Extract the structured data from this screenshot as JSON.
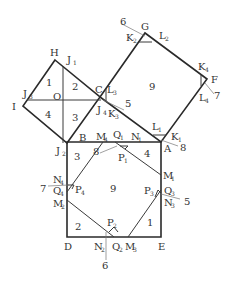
{
  "diagram": {
    "stroke_color": "#2a2a2a",
    "background": "#ffffff",
    "vertices": {
      "H": {
        "label": "H"
      },
      "I": {
        "label": "I"
      },
      "J1": {
        "label": "J",
        "sub": "1"
      },
      "J2": {
        "label": "J",
        "sub": "2"
      },
      "J3": {
        "label": "J",
        "sub": "3"
      },
      "J4": {
        "label": "J",
        "sub": "4"
      },
      "O": {
        "label": "O"
      },
      "C": {
        "label": "C"
      },
      "G": {
        "label": "G"
      },
      "F": {
        "label": "F"
      },
      "K1": {
        "label": "K",
        "sub": "1"
      },
      "K2": {
        "label": "K",
        "sub": "2"
      },
      "K3": {
        "label": "K",
        "sub": "3"
      },
      "K4": {
        "label": "K",
        "sub": "4"
      },
      "L1": {
        "label": "L",
        "sub": "1"
      },
      "L2": {
        "label": "L",
        "sub": "2"
      },
      "L3": {
        "label": "L",
        "sub": "3"
      },
      "L4": {
        "label": "L",
        "sub": "4"
      },
      "A": {
        "label": "A"
      },
      "B": {
        "label": "B"
      },
      "D": {
        "label": "D"
      },
      "E": {
        "label": "E"
      },
      "M1": {
        "label": "M",
        "sub": "1"
      },
      "M2": {
        "label": "M",
        "sub": "2"
      },
      "M3": {
        "label": "M",
        "sub": "3"
      },
      "M4": {
        "label": "M",
        "sub": "4"
      },
      "N1": {
        "label": "N",
        "sub": "1"
      },
      "N2": {
        "label": "N",
        "sub": "2"
      },
      "N3": {
        "label": "N",
        "sub": "3"
      },
      "N4": {
        "label": "N",
        "sub": "4"
      },
      "P1": {
        "label": "P",
        "sub": "1"
      },
      "P2": {
        "label": "P",
        "sub": "2"
      },
      "P3": {
        "label": "P",
        "sub": "3"
      },
      "P4": {
        "label": "P",
        "sub": "4"
      },
      "Q1": {
        "label": "Q",
        "sub": "1"
      },
      "Q2": {
        "label": "Q",
        "sub": "2"
      },
      "Q3": {
        "label": "Q",
        "sub": "3"
      },
      "Q4": {
        "label": "Q",
        "sub": "4"
      }
    },
    "region_numbers": {
      "small_square": [
        "1",
        "2",
        "3",
        "4"
      ],
      "medium_square": "9",
      "large_square": [
        "1",
        "2",
        "3",
        "4",
        "9"
      ]
    },
    "angle_callouts": {
      "G": "6",
      "F": "7",
      "C": "5",
      "A": "8",
      "Q1": "8",
      "Q4": "7",
      "N2": "6",
      "Q3": "5"
    }
  }
}
